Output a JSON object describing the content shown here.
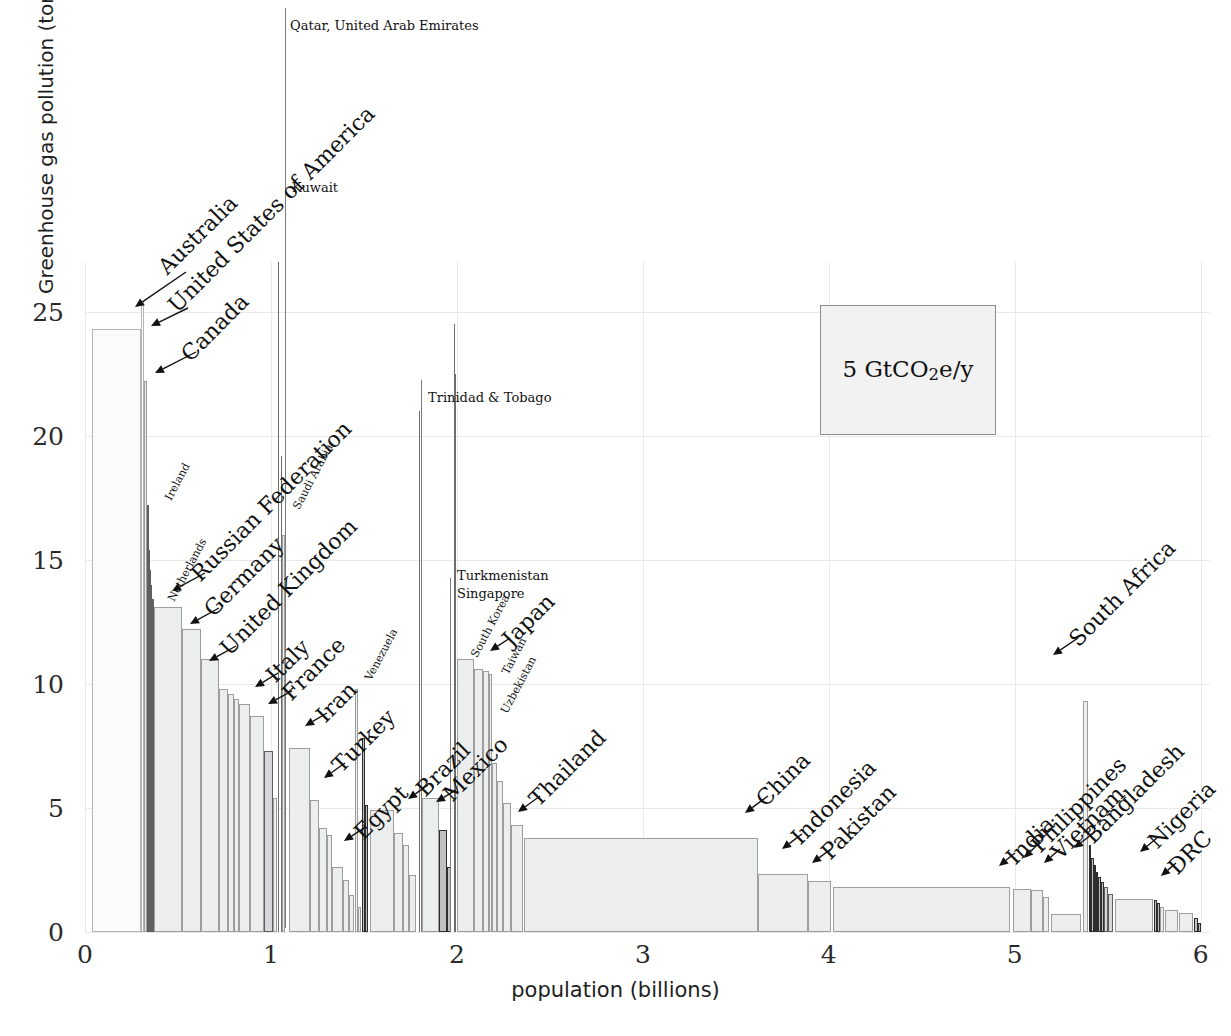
{
  "chart_data": {
    "type": "bar",
    "title": "",
    "subtitle": "",
    "xlabel": "population (billions)",
    "ylabel": "Greenhouse gas pollution (tons CO2e/y per person)",
    "ylabel_parts": {
      "pre": "Greenhouse gas pollution (tons CO",
      "sub": "2",
      "post": "e/y per person)"
    },
    "xlim": [
      0,
      6.05
    ],
    "ylim": [
      0,
      27
    ],
    "xticks": [
      0,
      1,
      2,
      3,
      4,
      5,
      6
    ],
    "xticklabels": [
      "0",
      "1",
      "2",
      "3",
      "4",
      "5",
      "6"
    ],
    "yticks": [
      0,
      5,
      10,
      15,
      20,
      25
    ],
    "yticklabels": [
      "0",
      "5",
      "10",
      "15",
      "20",
      "25"
    ],
    "grid": true,
    "legend": {
      "position": "inside-upper-right",
      "text": "5 GtCO2e/y",
      "area_meaning": "box area equals 5 GtCO2e/y"
    },
    "note": "Marimekko / variable-width bar chart: bar width = population (billions), bar height = per-capita greenhouse gas pollution (tons CO2e/y per person); area = total emissions.",
    "bars": [
      {
        "label": "Australia",
        "x0": 0.04,
        "x1": 0.3,
        "value": 24.3,
        "shade": "pale"
      },
      {
        "label": "United States of America",
        "x0": 0.3,
        "x1": 0.318,
        "value": 25.4,
        "shade": "pale"
      },
      {
        "label": "Canada",
        "x0": 0.318,
        "x1": 0.332,
        "value": 22.2,
        "shade": "light"
      },
      {
        "label": "Ireland",
        "x0": 0.332,
        "x1": 0.338,
        "value": 17.2,
        "shade": "dark"
      },
      {
        "label": "",
        "x0": 0.338,
        "x1": 0.345,
        "value": 15.4,
        "shade": "dark"
      },
      {
        "label": "",
        "x0": 0.345,
        "x1": 0.352,
        "value": 14.6,
        "shade": "dark"
      },
      {
        "label": "",
        "x0": 0.352,
        "x1": 0.36,
        "value": 14.0,
        "shade": "dark"
      },
      {
        "label": "Netherlands",
        "x0": 0.36,
        "x1": 0.372,
        "value": 13.4,
        "shade": "dark"
      },
      {
        "label": "Russian Federation",
        "x0": 0.372,
        "x1": 0.52,
        "value": 13.1,
        "shade": "light"
      },
      {
        "label": "Germany",
        "x0": 0.52,
        "x1": 0.625,
        "value": 12.2,
        "shade": "light"
      },
      {
        "label": "United Kingdom",
        "x0": 0.625,
        "x1": 0.72,
        "value": 11.0,
        "shade": "light"
      },
      {
        "label": "",
        "x0": 0.72,
        "x1": 0.77,
        "value": 9.8,
        "shade": "light"
      },
      {
        "label": "",
        "x0": 0.77,
        "x1": 0.8,
        "value": 9.6,
        "shade": "light"
      },
      {
        "label": "",
        "x0": 0.8,
        "x1": 0.828,
        "value": 9.4,
        "shade": "light"
      },
      {
        "label": "Italy",
        "x0": 0.828,
        "x1": 0.89,
        "value": 9.2,
        "shade": "light"
      },
      {
        "label": "France",
        "x0": 0.89,
        "x1": 0.96,
        "value": 8.7,
        "shade": "light"
      },
      {
        "label": "",
        "x0": 0.96,
        "x1": 1.01,
        "value": 7.3,
        "shade": "dark"
      },
      {
        "label": "",
        "x0": 1.01,
        "x1": 1.03,
        "value": 5.4,
        "shade": "light"
      },
      {
        "label": "Qatar, United Arab Emirates",
        "x0": 1.04,
        "x1": 1.046,
        "value": 27.0,
        "shade": "spike"
      },
      {
        "label": "Kuwait",
        "x0": 1.052,
        "x1": 1.058,
        "value": 19.2,
        "shade": "spike"
      },
      {
        "label": "Saudi Arabia",
        "x0": 1.058,
        "x1": 1.078,
        "value": 16.0,
        "shade": "light"
      },
      {
        "label": "Iran",
        "x0": 1.095,
        "x1": 1.21,
        "value": 7.4,
        "shade": "light"
      },
      {
        "label": "",
        "x0": 1.21,
        "x1": 1.26,
        "value": 5.3,
        "shade": "light"
      },
      {
        "label": "",
        "x0": 1.26,
        "x1": 1.3,
        "value": 4.2,
        "shade": "light"
      },
      {
        "label": "",
        "x0": 1.3,
        "x1": 1.33,
        "value": 3.9,
        "shade": "light"
      },
      {
        "label": "",
        "x0": 1.33,
        "x1": 1.39,
        "value": 2.6,
        "shade": "light"
      },
      {
        "label": "",
        "x0": 1.39,
        "x1": 1.42,
        "value": 2.1,
        "shade": "light"
      },
      {
        "label": "",
        "x0": 1.42,
        "x1": 1.445,
        "value": 1.5,
        "shade": "light"
      },
      {
        "label": "Venezuela",
        "x0": 1.452,
        "x1": 1.47,
        "value": 9.8,
        "shade": "light"
      },
      {
        "label": "",
        "x0": 1.47,
        "x1": 1.482,
        "value": 1.0,
        "shade": "light"
      },
      {
        "label": "Turkey",
        "x0": 1.49,
        "x1": 1.508,
        "value": 7.8,
        "shade": "vdark"
      },
      {
        "label": "",
        "x0": 1.508,
        "x1": 1.52,
        "value": 5.1,
        "shade": "vdark"
      },
      {
        "label": "Egypt",
        "x0": 1.53,
        "x1": 1.66,
        "value": 4.9,
        "shade": "light"
      },
      {
        "label": "",
        "x0": 1.66,
        "x1": 1.71,
        "value": 4.0,
        "shade": "light"
      },
      {
        "label": "",
        "x0": 1.71,
        "x1": 1.745,
        "value": 3.5,
        "shade": "light"
      },
      {
        "label": "",
        "x0": 1.745,
        "x1": 1.78,
        "value": 2.3,
        "shade": "light"
      },
      {
        "label": "Trinidad & Tobago",
        "x0": 1.795,
        "x1": 1.8,
        "value": 21.0,
        "shade": "spike"
      },
      {
        "label": "Brazil",
        "x0": 1.81,
        "x1": 1.905,
        "value": 5.4,
        "shade": "light"
      },
      {
        "label": "",
        "x0": 1.905,
        "x1": 1.945,
        "value": 4.1,
        "shade": "vdark"
      },
      {
        "label": "",
        "x0": 1.945,
        "x1": 1.97,
        "value": 2.6,
        "shade": "vdark"
      },
      {
        "label": "Turkmenistan",
        "x0": 1.985,
        "x1": 1.99,
        "value": 24.5,
        "shade": "spike"
      },
      {
        "label": "Singapore",
        "x0": 1.992,
        "x1": 1.996,
        "value": 22.5,
        "shade": "spike"
      },
      {
        "label": "Mexico",
        "x0": 2.0,
        "x1": 2.09,
        "value": 11.0,
        "shade": "light"
      },
      {
        "label": "South Korea",
        "x0": 2.09,
        "x1": 2.14,
        "value": 10.6,
        "shade": "light"
      },
      {
        "label": "Japan",
        "x0": 2.14,
        "x1": 2.175,
        "value": 10.5,
        "shade": "light"
      },
      {
        "label": "Taiwan",
        "x0": 2.175,
        "x1": 2.19,
        "value": 10.4,
        "shade": "light"
      },
      {
        "label": "",
        "x0": 2.19,
        "x1": 2.215,
        "value": 6.8,
        "shade": "light"
      },
      {
        "label": "Uzbekistan",
        "x0": 2.215,
        "x1": 2.25,
        "value": 6.1,
        "shade": "light"
      },
      {
        "label": "",
        "x0": 2.25,
        "x1": 2.29,
        "value": 5.2,
        "shade": "light"
      },
      {
        "label": "Thailand",
        "x0": 2.29,
        "x1": 2.355,
        "value": 4.3,
        "shade": "light"
      },
      {
        "label": "China",
        "x0": 2.36,
        "x1": 3.62,
        "value": 3.8,
        "shade": "light"
      },
      {
        "label": "",
        "x0": 3.62,
        "x1": 3.89,
        "value": 2.35,
        "shade": "light"
      },
      {
        "label": "Indonesia",
        "x0": 3.89,
        "x1": 4.01,
        "value": 2.05,
        "shade": "light"
      },
      {
        "label": "Pakistan",
        "x0": 4.02,
        "x1": 4.975,
        "value": 1.8,
        "shade": "light"
      },
      {
        "label": "India",
        "x0": 4.99,
        "x1": 5.085,
        "value": 1.72,
        "shade": "light"
      },
      {
        "label": "Philippines",
        "x0": 5.085,
        "x1": 5.15,
        "value": 1.68,
        "shade": "light"
      },
      {
        "label": "",
        "x0": 5.15,
        "x1": 5.185,
        "value": 1.4,
        "shade": "light"
      },
      {
        "label": "Vietnam",
        "x0": 5.195,
        "x1": 5.355,
        "value": 0.72,
        "shade": "light"
      },
      {
        "label": "South Africa",
        "x0": 5.365,
        "x1": 5.395,
        "value": 9.3,
        "shade": "light"
      },
      {
        "label": "",
        "x0": 5.4,
        "x1": 5.412,
        "value": 3.5,
        "shade": "vdark"
      },
      {
        "label": "",
        "x0": 5.412,
        "x1": 5.424,
        "value": 3.0,
        "shade": "vdark"
      },
      {
        "label": "",
        "x0": 5.424,
        "x1": 5.436,
        "value": 2.7,
        "shade": "vdark"
      },
      {
        "label": "",
        "x0": 5.436,
        "x1": 5.45,
        "value": 2.4,
        "shade": "vdark"
      },
      {
        "label": "",
        "x0": 5.45,
        "x1": 5.464,
        "value": 2.2,
        "shade": "vdark"
      },
      {
        "label": "",
        "x0": 5.464,
        "x1": 5.48,
        "value": 2.0,
        "shade": "vdark"
      },
      {
        "label": "",
        "x0": 5.48,
        "x1": 5.5,
        "value": 1.8,
        "shade": "dark"
      },
      {
        "label": "",
        "x0": 5.5,
        "x1": 5.53,
        "value": 1.55,
        "shade": "dark"
      },
      {
        "label": "Bangladesh",
        "x0": 5.54,
        "x1": 5.745,
        "value": 1.35,
        "shade": "light"
      },
      {
        "label": "",
        "x0": 5.75,
        "x1": 5.765,
        "value": 1.3,
        "shade": "vdark"
      },
      {
        "label": "",
        "x0": 5.765,
        "x1": 5.78,
        "value": 1.15,
        "shade": "vdark"
      },
      {
        "label": "",
        "x0": 5.782,
        "x1": 5.805,
        "value": 1.0,
        "shade": "light"
      },
      {
        "label": "Nigeria",
        "x0": 5.81,
        "x1": 5.88,
        "value": 0.9,
        "shade": "light"
      },
      {
        "label": "DRC",
        "x0": 5.885,
        "x1": 5.96,
        "value": 0.78,
        "shade": "light"
      },
      {
        "label": "",
        "x0": 5.962,
        "x1": 5.985,
        "value": 0.55,
        "shade": "vdark"
      },
      {
        "label": "",
        "x0": 5.985,
        "x1": 6.0,
        "value": 0.35,
        "shade": "vdark"
      }
    ],
    "annotations": [
      {
        "name": "Qatar, United Arab Emirates",
        "style": "flat"
      },
      {
        "name": "Kuwait",
        "style": "flat"
      },
      {
        "name": "Trinidad & Tobago",
        "style": "flat"
      },
      {
        "name": "Turkmenistan",
        "style": "flat"
      },
      {
        "name": "Singapore",
        "style": "flat"
      },
      {
        "name": "Australia",
        "style": "big"
      },
      {
        "name": "United States of America",
        "style": "big"
      },
      {
        "name": "Canada",
        "style": "big"
      },
      {
        "name": "Ireland",
        "style": "small"
      },
      {
        "name": "Netherlands",
        "style": "small"
      },
      {
        "name": "Russian Federation",
        "style": "big"
      },
      {
        "name": "Germany",
        "style": "big"
      },
      {
        "name": "United Kingdom",
        "style": "big"
      },
      {
        "name": "Saudi Arabia",
        "style": "small"
      },
      {
        "name": "Italy",
        "style": "big"
      },
      {
        "name": "France",
        "style": "big"
      },
      {
        "name": "Iran",
        "style": "big"
      },
      {
        "name": "Venezuela",
        "style": "small"
      },
      {
        "name": "Turkey",
        "style": "big"
      },
      {
        "name": "Egypt",
        "style": "big"
      },
      {
        "name": "Brazil",
        "style": "big"
      },
      {
        "name": "Mexico",
        "style": "big"
      },
      {
        "name": "South Korea",
        "style": "small"
      },
      {
        "name": "Japan",
        "style": "big"
      },
      {
        "name": "Taiwan",
        "style": "small"
      },
      {
        "name": "Uzbekistan",
        "style": "small"
      },
      {
        "name": "Thailand",
        "style": "big"
      },
      {
        "name": "China",
        "style": "big"
      },
      {
        "name": "Indonesia",
        "style": "big"
      },
      {
        "name": "Pakistan",
        "style": "big"
      },
      {
        "name": "South Africa",
        "style": "big"
      },
      {
        "name": "India",
        "style": "big"
      },
      {
        "name": "Philippines",
        "style": "big"
      },
      {
        "name": "Vietnam",
        "style": "big"
      },
      {
        "name": "Bangladesh",
        "style": "big"
      },
      {
        "name": "Nigeria",
        "style": "big"
      },
      {
        "name": "DRC",
        "style": "big"
      }
    ]
  },
  "axes": {
    "x_title": "population (billions)",
    "y_title_pre": "Greenhouse gas pollution (tons CO",
    "y_title_sub": "2",
    "y_title_post": "e/y per person)",
    "xticklabels": [
      "0",
      "1",
      "2",
      "3",
      "4",
      "5",
      "6"
    ],
    "yticklabels": [
      "0",
      "5",
      "10",
      "15",
      "20",
      "25"
    ]
  },
  "legend": {
    "value": "5",
    "unit_pre": "GtCO",
    "unit_sub": "2",
    "unit_post": "e/y",
    "full": "5 GtCO2e/y"
  },
  "labels": {
    "qatar_uae": "Qatar, United Arab Emirates",
    "kuwait": "Kuwait",
    "trinidad": "Trinidad & Tobago",
    "turkmenistan": "Turkmenistan",
    "singapore": "Singapore",
    "australia": "Australia",
    "usa": "United States of America",
    "canada": "Canada",
    "ireland": "Ireland",
    "netherlands": "Netherlands",
    "russia": "Russian Federation",
    "germany": "Germany",
    "uk": "United Kingdom",
    "saudi": "Saudi Arabia",
    "italy": "Italy",
    "france": "France",
    "iran": "Iran",
    "venezuela": "Venezuela",
    "turkey": "Turkey",
    "egypt": "Egypt",
    "brazil": "Brazil",
    "mexico": "Mexico",
    "south_korea": "South Korea",
    "japan": "Japan",
    "taiwan": "Taiwan",
    "uzbekistan": "Uzbekistan",
    "thailand": "Thailand",
    "china": "China",
    "indonesia": "Indonesia",
    "pakistan": "Pakistan",
    "south_africa": "South Africa",
    "india": "India",
    "philippines": "Philippines",
    "vietnam": "Vietnam",
    "bangladesh": "Bangladesh",
    "nigeria": "Nigeria",
    "drc": "DRC"
  }
}
